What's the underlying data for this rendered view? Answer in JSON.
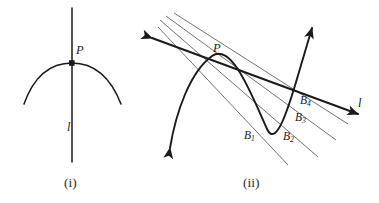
{
  "figure": {
    "background_color": "#ffffff",
    "stroke_color": "#1a1a1a",
    "secant_color": "#555555",
    "panels": [
      {
        "id": "panel-i",
        "caption": "(i)",
        "description": "A curve with its tangent line l touching at point P.",
        "labels": [
          {
            "name": "point-P",
            "text": "P"
          },
          {
            "name": "line-l",
            "text": "l"
          }
        ]
      },
      {
        "id": "panel-ii",
        "caption": "(ii)",
        "description": "A parabola-like curve with secant lines from P through points B1, B2, B3, B4 approaching the tangent line l.",
        "labels": [
          {
            "name": "point-P",
            "text": "P"
          },
          {
            "name": "line-l",
            "text": "l"
          },
          {
            "name": "point-B1",
            "base": "B",
            "subscript": "1"
          },
          {
            "name": "point-B2",
            "base": "B",
            "subscript": "2"
          },
          {
            "name": "point-B3",
            "base": "B",
            "subscript": "3"
          },
          {
            "name": "point-B4",
            "base": "B",
            "subscript": "4"
          }
        ]
      }
    ]
  },
  "labels": {
    "P_left": "P",
    "l_left": "l",
    "P_right": "P",
    "l_right": "l",
    "B_base": "B",
    "B1_sub": "1",
    "B2_sub": "2",
    "B3_sub": "3",
    "B4_sub": "4"
  },
  "captions": {
    "left": "(i)",
    "right": "(ii)"
  }
}
